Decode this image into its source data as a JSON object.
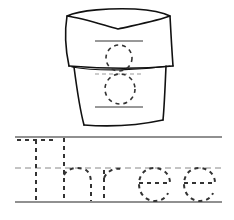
{
  "worksheet": {
    "number_digit": "8",
    "word": "Three",
    "trace_word_letters": [
      "T",
      "h",
      "r",
      "e",
      "e"
    ],
    "illustration": "flower-pot",
    "colors": {
      "ink": "#111111",
      "dashed": "#333333",
      "guide_dashed": "#888888",
      "background": "#ffffff"
    }
  }
}
